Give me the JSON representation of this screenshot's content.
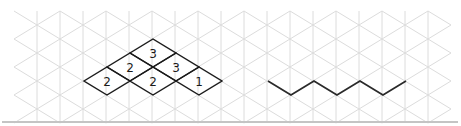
{
  "grid": {
    "origin_x": 37,
    "origin_y": 11,
    "step_x": 23,
    "step_y": 14,
    "col_min": -1,
    "col_max": 18,
    "row_min": 0,
    "row_max": 8,
    "line_color": "#dcdcdc",
    "baseline": {
      "x1": 2,
      "x2": 458,
      "y": 122,
      "color": "#c4c4c4"
    }
  },
  "stack_figure": {
    "cells": [
      {
        "cx": 107,
        "cy": 81,
        "label": "2"
      },
      {
        "cx": 130,
        "cy": 67,
        "label": "2"
      },
      {
        "cx": 153,
        "cy": 53,
        "label": "3"
      },
      {
        "cx": 153,
        "cy": 81,
        "label": "2"
      },
      {
        "cx": 176,
        "cy": 67,
        "label": "3"
      },
      {
        "cx": 199,
        "cy": 81,
        "label": "1"
      }
    ],
    "half_width": 23,
    "half_height": 14,
    "stroke_color": "#1a1a1a"
  },
  "zigzag_path": {
    "points": [
      [
        268,
        81
      ],
      [
        291,
        95
      ],
      [
        314,
        81
      ],
      [
        337,
        95
      ],
      [
        360,
        81
      ],
      [
        383,
        95
      ],
      [
        406,
        81
      ]
    ],
    "stroke_color": "#2a2a2a"
  }
}
